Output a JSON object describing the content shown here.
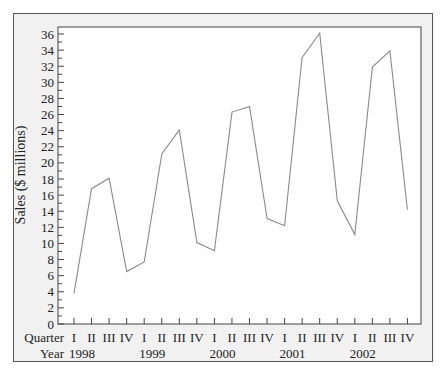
{
  "chart_data": {
    "type": "line",
    "title": "",
    "xlabel": "Quarter / Year",
    "ylabel": "Sales ($ millions)",
    "ylim": [
      0,
      36
    ],
    "y_ticks": [
      0,
      2,
      4,
      6,
      8,
      10,
      12,
      14,
      16,
      18,
      20,
      22,
      24,
      26,
      28,
      30,
      32,
      34,
      36
    ],
    "grid": false,
    "legend": null,
    "x_row_labels": {
      "quarter": "Quarter",
      "year": "Year"
    },
    "quarters": [
      "I",
      "II",
      "III",
      "IV",
      "I",
      "II",
      "III",
      "IV",
      "I",
      "II",
      "III",
      "IV",
      "I",
      "II",
      "III",
      "IV",
      "I",
      "II",
      "III",
      "IV"
    ],
    "years": [
      "1998",
      "1999",
      "2000",
      "2001",
      "2002"
    ],
    "series": [
      {
        "name": "Sales",
        "color": "#8a8a8a",
        "x": [
          "1998 I",
          "1998 II",
          "1998 III",
          "1998 IV",
          "1999 I",
          "1999 II",
          "1999 III",
          "1999 IV",
          "2000 I",
          "2000 II",
          "2000 III",
          "2000 IV",
          "2001 I",
          "2001 II",
          "2001 III",
          "2001 IV",
          "2002 I",
          "2002 II",
          "2002 III",
          "2002 IV"
        ],
        "values": [
          3.8,
          16.8,
          18.1,
          6.5,
          7.7,
          21.1,
          24.1,
          10.1,
          9.1,
          26.3,
          27.0,
          13.1,
          12.2,
          33.1,
          36.1,
          15.3,
          11.1,
          31.9,
          33.9,
          14.2
        ]
      }
    ]
  },
  "labels": {
    "ylabel": "Sales ($ millions)",
    "quarter_row": "Quarter",
    "year_row": "Year"
  },
  "colors": {
    "frame_bg": "#f1f1f1",
    "plot_bg": "#ffffff",
    "line": "#8a8a8a",
    "axis": "#444444"
  }
}
